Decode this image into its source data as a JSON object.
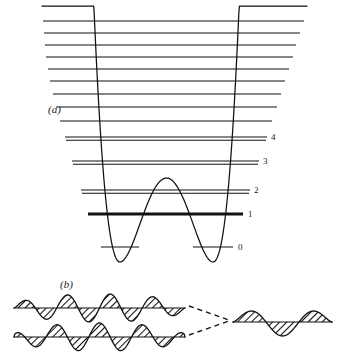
{
  "figure": {
    "title_visible": false,
    "panels": [
      {
        "tag": "(a)",
        "tag_x": 48,
        "tag_y": 113,
        "description": "double-well inversion potential with quantized vibrational energy levels"
      },
      {
        "tag": "(b)",
        "tag_x": 60,
        "tag_y": 288,
        "description": "vibrational wavefunctions with hatched shading"
      }
    ]
  },
  "chart_data": {
    "type": "line",
    "title": "",
    "xlabel": "",
    "ylabel": "",
    "grid": false,
    "legend": false,
    "potential": {
      "name": "double-well potential",
      "left_wall_top": {
        "x": 42,
        "y": 8
      },
      "right_wall_top": {
        "x": 307,
        "y": 10
      },
      "left_min": {
        "x": 120,
        "y": 262
      },
      "right_min": {
        "x": 213,
        "y": 262
      },
      "barrier_peak": {
        "x": 167,
        "y": 178
      }
    },
    "levels": [
      {
        "label": "0",
        "y": 247,
        "x_start": 101,
        "x_end": 233,
        "split": true,
        "thick": false,
        "label_x": 238,
        "label_y": 250
      },
      {
        "label": "1",
        "y": 214,
        "x_start": 88,
        "x_end": 243,
        "split": false,
        "thick": true,
        "label_x": 248,
        "label_y": 217
      },
      {
        "label": "2",
        "y": 190,
        "x_start": 81,
        "x_end": 250,
        "split": false,
        "thick": false,
        "doublet": true,
        "label_x": 254,
        "label_y": 193
      },
      {
        "label": "3",
        "y": 161,
        "x_start": 72,
        "x_end": 259,
        "split": false,
        "thick": false,
        "doublet": true,
        "label_x": 263,
        "label_y": 164
      },
      {
        "label": "4",
        "y": 137,
        "x_start": 65,
        "x_end": 267,
        "split": false,
        "thick": false,
        "doublet": true,
        "label_x": 271,
        "label_y": 140
      },
      {
        "label": "",
        "y": 121,
        "x_start": 60,
        "x_end": 272,
        "split": false,
        "thick": false
      },
      {
        "label": "",
        "y": 107,
        "x_start": 56,
        "x_end": 277,
        "split": false,
        "thick": false
      },
      {
        "label": "",
        "y": 94,
        "x_start": 53,
        "x_end": 281,
        "split": false,
        "thick": false
      },
      {
        "label": "",
        "y": 81,
        "x_start": 50,
        "x_end": 285,
        "split": false,
        "thick": false
      },
      {
        "label": "",
        "y": 69,
        "x_start": 48,
        "x_end": 289,
        "split": false,
        "thick": false
      },
      {
        "label": "",
        "y": 57,
        "x_start": 46,
        "x_end": 293,
        "split": false,
        "thick": false
      },
      {
        "label": "",
        "y": 45,
        "x_start": 45,
        "x_end": 296,
        "split": false,
        "thick": false
      },
      {
        "label": "",
        "y": 33,
        "x_start": 44,
        "x_end": 300,
        "split": false,
        "thick": false
      },
      {
        "label": "",
        "y": 21,
        "x_start": 43,
        "x_end": 304,
        "split": false,
        "thick": false
      }
    ],
    "wavefunctions": [
      {
        "name": "upper-left-wavefunction",
        "axis_y": 308,
        "x_start": 14,
        "x_end": 185,
        "lobes": 8,
        "amplitude": 14,
        "phase": 0
      },
      {
        "name": "lower-left-wavefunction",
        "axis_y": 337,
        "x_start": 14,
        "x_end": 185,
        "lobes": 8,
        "amplitude": 14,
        "phase": 0.5
      },
      {
        "name": "right-wavefunction",
        "axis_y": 322,
        "x_start": 233,
        "x_end": 332,
        "lobes": 3,
        "amplitude": 14,
        "phase": 0
      }
    ],
    "connectors": [
      {
        "name": "upper-dash",
        "x1": 189,
        "y1": 306,
        "x2": 229,
        "y2": 320
      },
      {
        "name": "lower-dash",
        "x1": 189,
        "y1": 335,
        "x2": 229,
        "y2": 321
      }
    ]
  }
}
